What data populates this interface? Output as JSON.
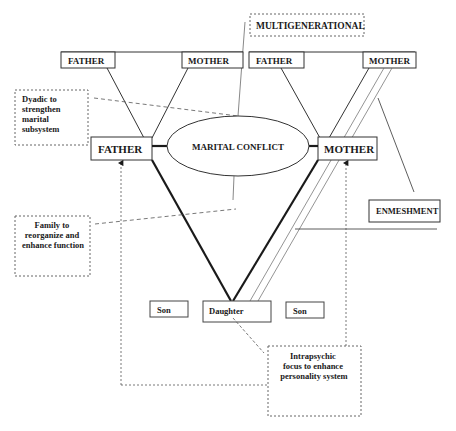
{
  "diagram": {
    "labels": {
      "multigenerational": "MULTIGENERATIONAL",
      "gp_left_father": "FATHER",
      "gp_left_mother": "MOTHER",
      "gp_right_father": "FATHER",
      "gp_right_mother": "MOTHER",
      "father": "FATHER",
      "mother": "MOTHER",
      "marital_conflict": "MARITAL CONFLICT",
      "enmeshment": "ENMESHMENT",
      "son_left": "Son",
      "daughter": "Daughter",
      "son_right": "Son"
    },
    "notes": {
      "dyadic": [
        "Dyadic to",
        "strengthen",
        "marital",
        "subsystem"
      ],
      "family": [
        "Family to",
        "reorganize and",
        "enhance function"
      ],
      "intrapsychic": [
        "Intrapsychic",
        "focus to enhance",
        "personality system"
      ]
    },
    "colors": {
      "line": "#1a1a1a",
      "thin_line": "#555555",
      "dashed": "#555555",
      "background": "#ffffff"
    }
  }
}
